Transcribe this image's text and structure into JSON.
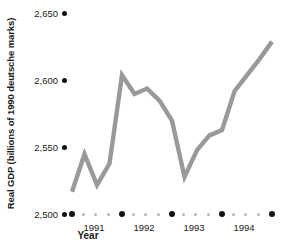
{
  "chart_data": {
    "type": "line",
    "title": "",
    "xlabel": "Year",
    "ylabel": "Real GDP (billions of 1990 deutsche marks)",
    "ylim": [
      2500,
      2650
    ],
    "y_ticks": [
      2500,
      2550,
      2600,
      2650
    ],
    "y_tick_labels": [
      "2,500",
      "2,550",
      "2,600",
      "2,650"
    ],
    "x_tick_labels": [
      "1991",
      "1992",
      "1993",
      "1994"
    ],
    "x_minor_ticks_per_year": 3,
    "grid": false,
    "legend": "none",
    "line_color": "#999999",
    "x": [
      "1990Q4",
      "1991Q1",
      "1991Q2",
      "1991Q3",
      "1991Q4",
      "1992Q1",
      "1992Q2",
      "1992Q3",
      "1992Q4",
      "1993Q1",
      "1993Q2",
      "1993Q3",
      "1993Q4",
      "1994Q1",
      "1994Q2",
      "1994Q3",
      "1994Q4"
    ],
    "values": [
      2517,
      2545,
      2522,
      2538,
      2604,
      2590,
      2594,
      2585,
      2570,
      2528,
      2548,
      2559,
      2563,
      2592,
      2604,
      2616,
      2629
    ]
  },
  "axes": {
    "y_title": "Real GDP (billions of 1990 deutsche marks)",
    "x_title": "Year"
  }
}
